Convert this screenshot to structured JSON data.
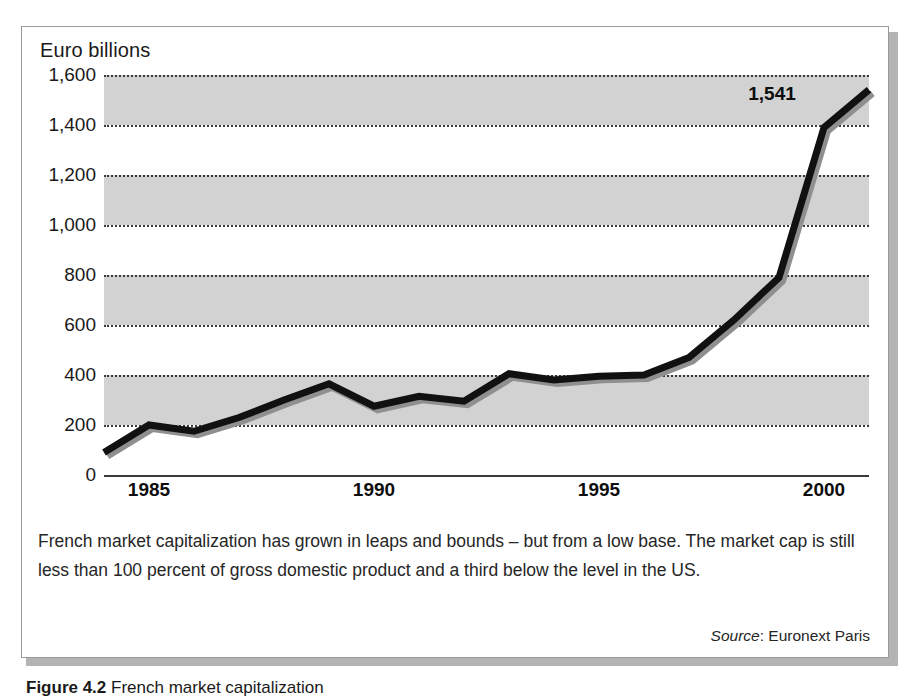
{
  "figure": {
    "axis_title": "Euro billions",
    "caption": "French market capitalization has grown in leaps and bounds – but from a low base. The market cap is still less than 100 percent of gross domestic product and a third below the level in the US.",
    "source_word": "Source",
    "source_rest": ": Euronext Paris",
    "figure_caption_prefix": "Figure 4.2",
    "figure_caption_rest": "  French market capitalization"
  },
  "chart_data": {
    "type": "line",
    "title": "",
    "subtitle": "",
    "xlabel": "",
    "ylabel": "Euro billions",
    "ylim": [
      0,
      1600
    ],
    "xlim": [
      1984,
      2001
    ],
    "ytick_labels": [
      "0",
      "200",
      "400",
      "600",
      "800",
      "1,000",
      "1,200",
      "1,400",
      "1,600"
    ],
    "ytick_values": [
      0,
      200,
      400,
      600,
      800,
      1000,
      1200,
      1400,
      1600
    ],
    "xtick_labels": [
      "1985",
      "1990",
      "1995",
      "2000"
    ],
    "xtick_values": [
      1985,
      1990,
      1995,
      2000
    ],
    "grid": "horizontal-dotted",
    "banding": "alternating-gray",
    "band_color": "#d2d2d2",
    "line_color": "#111111",
    "shadow_color": "#8f8f8f",
    "legend": "none",
    "x": [
      1984,
      1985,
      1986,
      1987,
      1988,
      1989,
      1990,
      1991,
      1992,
      1993,
      1994,
      1995,
      1996,
      1997,
      1998,
      1999,
      2000,
      2001
    ],
    "values": [
      90,
      200,
      175,
      230,
      300,
      365,
      275,
      315,
      295,
      405,
      380,
      395,
      400,
      470,
      620,
      790,
      1390,
      1541
    ],
    "series": [
      {
        "name": "French market capitalization",
        "values": [
          90,
          200,
          175,
          230,
          300,
          365,
          275,
          315,
          295,
          405,
          380,
          395,
          400,
          470,
          620,
          790,
          1390,
          1541
        ]
      }
    ],
    "annotations": [
      {
        "text": "1,541",
        "x": 2000.0,
        "y": 1541,
        "bold": true
      }
    ]
  }
}
